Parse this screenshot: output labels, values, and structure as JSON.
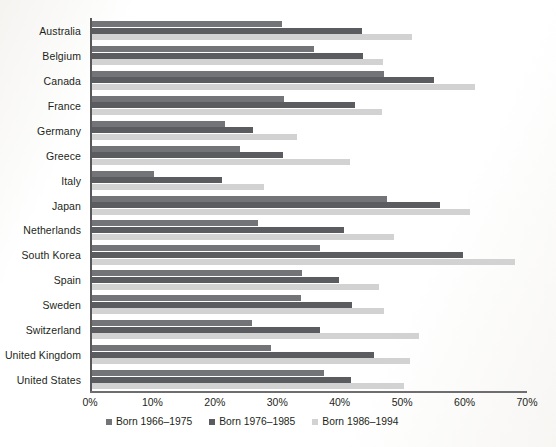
{
  "chart_data": {
    "type": "bar",
    "orientation": "horizontal",
    "title": "",
    "xlabel": "",
    "ylabel": "",
    "xlim": [
      0,
      70
    ],
    "xunit": "%",
    "grid": false,
    "legend_position": "bottom",
    "xticks": [
      {
        "value": 0,
        "label": "0%"
      },
      {
        "value": 10,
        "label": "10%"
      },
      {
        "value": 20,
        "label": "20%"
      },
      {
        "value": 30,
        "label": "30%"
      },
      {
        "value": 40,
        "label": "40%"
      },
      {
        "value": 50,
        "label": "50%"
      },
      {
        "value": 60,
        "label": "60%"
      },
      {
        "value": 70,
        "label": "70%"
      }
    ],
    "categories": [
      "Australia",
      "Belgium",
      "Canada",
      "France",
      "Germany",
      "Greece",
      "Italy",
      "Japan",
      "Netherlands",
      "South Korea",
      "Spain",
      "Sweden",
      "Switzerland",
      "United Kingdom",
      "United States"
    ],
    "series": [
      {
        "name": "Born 1966–1975",
        "color": "#737477",
        "values": [
          30.5,
          35.5,
          46.8,
          30.8,
          21.3,
          23.7,
          9.9,
          47.3,
          26.6,
          36.5,
          33.6,
          33.4,
          25.6,
          28.7,
          37.2
        ]
      },
      {
        "name": "Born 1976–1985",
        "color": "#5b5c5f",
        "values": [
          43.3,
          43.4,
          54.8,
          42.2,
          25.8,
          30.6,
          20.8,
          55.8,
          40.4,
          59.4,
          39.6,
          41.7,
          36.5,
          45.2,
          41.5
        ]
      },
      {
        "name": "Born 1986–1994",
        "color": "#d2d2d2",
        "values": [
          51.3,
          46.6,
          61.4,
          46.5,
          32.8,
          41.3,
          27.5,
          60.6,
          48.4,
          67.8,
          46.0,
          46.8,
          52.4,
          51.0,
          50.0
        ]
      }
    ]
  }
}
